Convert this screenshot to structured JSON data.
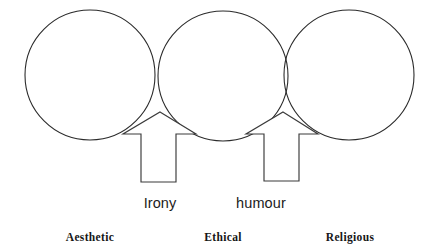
{
  "diagram": {
    "background_color": "#ffffff",
    "stroke_color": "#2b2b2b",
    "circles": [
      {
        "id": "circle-aesthetic",
        "cx": 90,
        "cy": 75,
        "r": 65
      },
      {
        "id": "circle-ethical",
        "cx": 223,
        "cy": 76,
        "r": 65
      },
      {
        "id": "circle-religious",
        "cx": 349,
        "cy": 75,
        "r": 65
      }
    ],
    "arrows": [
      {
        "id": "arrow-irony",
        "tip_x": 160,
        "tip_y": 112,
        "label": "Irony"
      },
      {
        "id": "arrow-humour",
        "tip_x": 283,
        "tip_y": 112,
        "label": "humour"
      }
    ],
    "flow_labels": [
      {
        "text": "Irony",
        "x": 160,
        "y": 196
      },
      {
        "text": "humour",
        "x": 261,
        "y": 196
      }
    ],
    "stage_labels": [
      {
        "text": "Aesthetic",
        "x": 90,
        "y": 232
      },
      {
        "text": "Ethical",
        "x": 223,
        "y": 232
      },
      {
        "text": "Religious",
        "x": 350,
        "y": 232
      }
    ]
  }
}
